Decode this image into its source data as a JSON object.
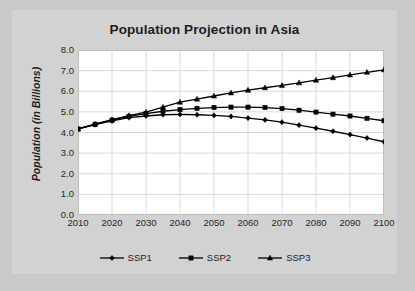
{
  "chart_data": {
    "type": "line",
    "title": "Population Projection in Asia",
    "xlabel": "",
    "ylabel": "Population (in Billions)",
    "xlim": [
      2010,
      2100
    ],
    "ylim": [
      0.0,
      8.0
    ],
    "ytick_step": 1.0,
    "xtick_step": 10,
    "grid": true,
    "legend_position": "bottom",
    "x": [
      2010,
      2015,
      2020,
      2025,
      2030,
      2035,
      2040,
      2045,
      2050,
      2055,
      2060,
      2065,
      2070,
      2075,
      2080,
      2085,
      2090,
      2095,
      2100
    ],
    "xticks": [
      "2010",
      "2020",
      "2030",
      "2040",
      "2050",
      "2060",
      "2070",
      "2080",
      "2090",
      "2100"
    ],
    "yticks": [
      "0.0",
      "1.0",
      "2.0",
      "3.0",
      "4.0",
      "5.0",
      "6.0",
      "7.0",
      "8.0"
    ],
    "series": [
      {
        "name": "SSP1",
        "marker": "diamond",
        "color": "#000000",
        "values": [
          4.17,
          4.38,
          4.56,
          4.72,
          4.8,
          4.86,
          4.88,
          4.86,
          4.83,
          4.78,
          4.7,
          4.61,
          4.5,
          4.36,
          4.21,
          4.06,
          3.9,
          3.73,
          3.55
        ]
      },
      {
        "name": "SSP2",
        "marker": "square",
        "color": "#000000",
        "values": [
          4.17,
          4.4,
          4.6,
          4.78,
          4.92,
          5.03,
          5.11,
          5.17,
          5.21,
          5.23,
          5.23,
          5.21,
          5.16,
          5.08,
          4.99,
          4.89,
          4.8,
          4.69,
          4.57
        ]
      },
      {
        "name": "SSP3",
        "marker": "triangle",
        "color": "#000000",
        "values": [
          4.17,
          4.4,
          4.62,
          4.82,
          4.99,
          5.23,
          5.47,
          5.62,
          5.77,
          5.92,
          6.05,
          6.17,
          6.28,
          6.41,
          6.54,
          6.66,
          6.79,
          6.92,
          7.04
        ]
      }
    ]
  },
  "legend": {
    "items": [
      {
        "label": "SSP1"
      },
      {
        "label": "SSP2"
      },
      {
        "label": "SSP3"
      }
    ]
  },
  "colors": {
    "page_background": "#c9c9c9",
    "panel_background": "#d2d2d2",
    "plot_background": "#ffffff",
    "gridline": "#d9d9d9",
    "axis": "#bfbfbf",
    "text": "#1d1d1d",
    "series": "#000000"
  }
}
